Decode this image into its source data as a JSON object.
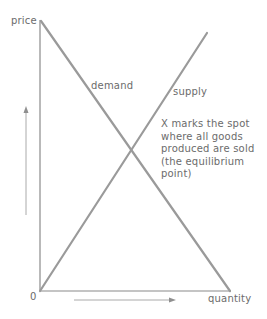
{
  "diagram": {
    "axes": {
      "y_label": "price",
      "x_label": "quantity",
      "origin_label": "0"
    },
    "curves": {
      "demand_label": "demand",
      "supply_label": "supply"
    },
    "annotation": {
      "lines": [
        "X marks the spot",
        "where all goods",
        "produced are sold",
        "(the equilibrium",
        "point)"
      ]
    },
    "colors": {
      "axis": "#8a8a8a",
      "curve": "#9a9a9a",
      "text": "#6b6b6b",
      "arrow": "#8f8f8f"
    }
  }
}
